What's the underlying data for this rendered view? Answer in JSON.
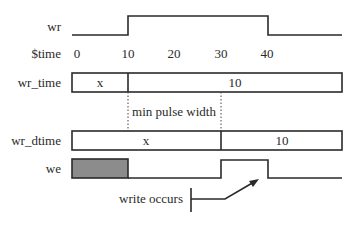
{
  "diagram": {
    "colors": {
      "line": "#2a2a2a",
      "unknown_fill": "#8c8c8c",
      "background": "#ffffff"
    },
    "labels": {
      "wr": "wr",
      "time": "$time",
      "wr_time": "wr_time",
      "wr_dtime": "wr_dtime",
      "we": "we"
    },
    "time_ticks": [
      "0",
      "10",
      "20",
      "30",
      "40"
    ],
    "wr_time_values": {
      "before": "x",
      "after": "10"
    },
    "wr_dtime_values": {
      "before": "x",
      "after": "10"
    },
    "annotations": {
      "min_pulse": "min pulse width",
      "write_occurs": "write occurs"
    }
  }
}
